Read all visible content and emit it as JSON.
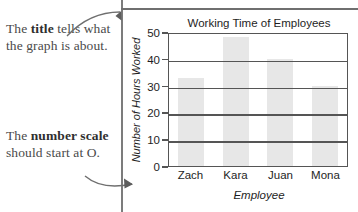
{
  "annotations": [
    {
      "id": "title-callout",
      "text_parts": [
        "The ",
        "title",
        " tells what the graph is about."
      ],
      "plain": "The title tells what the graph is about.",
      "emphasis": "title",
      "points_to": "chart-title"
    },
    {
      "id": "scale-callout",
      "text_parts": [
        "The ",
        "number scale",
        " should start at O."
      ],
      "plain": "The number scale should start at O.",
      "emphasis": "number scale",
      "points_to": "y-axis-zero-tick"
    }
  ],
  "chart_data": {
    "type": "bar",
    "title": "Working Time of Employees",
    "xlabel": "Employee",
    "ylabel": "Number of Hours Worked",
    "categories": [
      "Zach",
      "Kara",
      "Juan",
      "Mona"
    ],
    "values": [
      33,
      48,
      40,
      30
    ],
    "ylim": [
      0,
      50
    ],
    "yticks": [
      50,
      40,
      30,
      20,
      10,
      0
    ],
    "grid": "horizontal",
    "legend": "none",
    "bar_color": "#e7e7e7",
    "axis_color": "#555555"
  }
}
